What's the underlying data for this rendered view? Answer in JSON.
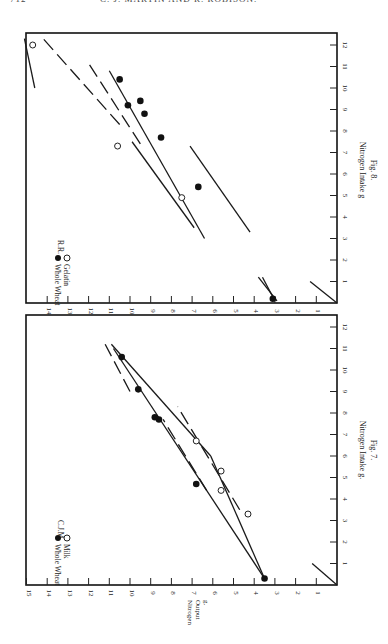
{
  "page": {
    "page_number": "712",
    "running_head": "C. J. MARTIN AND R. ROBISON."
  },
  "chart_data": [
    {
      "type": "scatter",
      "figure_label": "Fig. 7.",
      "subject": "C.J.M.",
      "xlabel": "Nitrogen Intake g.",
      "ylabel": "Nitrogen Output g.",
      "xlim": [
        0,
        12
      ],
      "ylim": [
        0,
        15
      ],
      "x_ticks": [
        1,
        2,
        3,
        4,
        5,
        6,
        7,
        8,
        9,
        10,
        11,
        12
      ],
      "y_ticks": [
        1,
        2,
        3,
        4,
        5,
        6,
        7,
        8,
        9,
        10,
        11,
        12,
        13,
        14,
        15
      ],
      "orientation": "rotated-90-clockwise",
      "legend": [
        {
          "label": "Whole Wheat",
          "marker": "filled-circle"
        },
        {
          "label": "Milk",
          "marker": "open-circle"
        }
      ],
      "series": [
        {
          "name": "Whole Wheat",
          "marker": "filled-circle",
          "points": [
            [
              0.3,
              3.5
            ],
            [
              4.7,
              6.8
            ],
            [
              7.7,
              8.6
            ],
            [
              7.8,
              8.8
            ],
            [
              9.1,
              9.6
            ],
            [
              10.6,
              10.4
            ]
          ]
        },
        {
          "name": "Milk",
          "marker": "open-circle",
          "points": [
            [
              3.3,
              4.3
            ],
            [
              4.4,
              5.6
            ],
            [
              5.3,
              5.6
            ],
            [
              6.7,
              6.8
            ]
          ]
        }
      ],
      "lines": [
        {
          "style": "solid",
          "from": [
            0.3,
            3.5
          ],
          "to": [
            11.0,
            10.8
          ]
        },
        {
          "style": "solid",
          "from": [
            0.3,
            3.5
          ],
          "to": [
            6.0,
            6.1
          ]
        },
        {
          "style": "solid",
          "from": [
            6.0,
            6.1
          ],
          "to": [
            11.2,
            10.9
          ]
        },
        {
          "style": "dashed",
          "from": [
            3.5,
            4.7
          ],
          "to": [
            8.3,
            7.7
          ]
        },
        {
          "style": "dashed",
          "from": [
            4.4,
            6.3
          ],
          "to": [
            7.7,
            8.4
          ]
        },
        {
          "style": "dashed",
          "from": [
            9.0,
            10.0
          ],
          "to": [
            11.2,
            11.2
          ]
        },
        {
          "style": "solid",
          "from": [
            0.0,
            0.0
          ],
          "to": [
            1.0,
            1.2
          ]
        }
      ]
    },
    {
      "type": "scatter",
      "figure_label": "Fig. 8.",
      "subject": "R.R.",
      "xlabel": "Nitrogen Intake g",
      "ylabel": "",
      "xlim": [
        0,
        12
      ],
      "ylim": [
        0,
        15
      ],
      "x_ticks": [
        1,
        2,
        3,
        4,
        5,
        6,
        7,
        8,
        9,
        10,
        11,
        12
      ],
      "y_ticks": [
        1,
        2,
        3,
        4,
        5,
        6,
        7,
        8,
        9,
        10,
        11,
        12,
        13,
        14
      ],
      "orientation": "rotated-90-clockwise",
      "legend": [
        {
          "label": "Whole Wheat",
          "marker": "filled-circle"
        },
        {
          "label": "Gelatin",
          "marker": "open-circle"
        }
      ],
      "series": [
        {
          "name": "Whole Wheat",
          "marker": "filled-circle",
          "points": [
            [
              0.2,
              3.1
            ],
            [
              5.4,
              6.7
            ],
            [
              7.7,
              8.5
            ],
            [
              8.8,
              9.3
            ],
            [
              9.2,
              10.1
            ],
            [
              9.4,
              9.5
            ],
            [
              10.4,
              10.5
            ]
          ]
        },
        {
          "name": "Gelatin",
          "marker": "open-circle",
          "points": [
            [
              4.9,
              7.5
            ],
            [
              7.3,
              10.6
            ],
            [
              12.0,
              14.7
            ]
          ]
        }
      ],
      "lines": [
        {
          "style": "solid",
          "from": [
            0.1,
            2.9
          ],
          "to": [
            1.2,
            3.8
          ]
        },
        {
          "style": "solid",
          "from": [
            0.1,
            3.0
          ],
          "to": [
            1.2,
            3.6
          ]
        },
        {
          "style": "solid",
          "from": [
            3.0,
            6.4
          ],
          "to": [
            10.8,
            11.0
          ]
        },
        {
          "style": "solid",
          "from": [
            3.3,
            4.2
          ],
          "to": [
            7.3,
            7.1
          ]
        },
        {
          "style": "solid",
          "from": [
            3.5,
            6.9
          ],
          "to": [
            7.5,
            9.9
          ]
        },
        {
          "style": "dashed",
          "from": [
            7.4,
            9.5
          ],
          "to": [
            11.3,
            12.1
          ]
        },
        {
          "style": "dashed",
          "from": [
            8.3,
            10.5
          ],
          "to": [
            12.3,
            14.2
          ]
        },
        {
          "style": "solid",
          "from": [
            10.0,
            14.6
          ],
          "to": [
            12.3,
            15.1
          ]
        },
        {
          "style": "solid",
          "from": [
            0.0,
            0.0
          ],
          "to": [
            1.0,
            1.3
          ]
        }
      ]
    }
  ]
}
